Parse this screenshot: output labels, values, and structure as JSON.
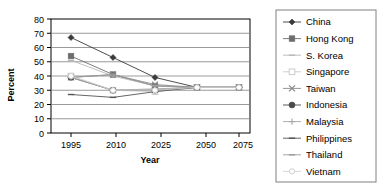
{
  "chart_data": {
    "type": "line",
    "title": "",
    "xlabel": "Year",
    "ylabel": "Percent",
    "categories": [
      "1995",
      "2010",
      "2025",
      "2050",
      "2075"
    ],
    "x": [
      1995,
      2010,
      2025,
      2050,
      2075
    ],
    "ylim": [
      0,
      80
    ],
    "yticks": [
      0,
      10,
      20,
      30,
      40,
      50,
      60,
      70,
      80
    ],
    "grid": true,
    "legend_position": "right",
    "series": [
      {
        "name": "China",
        "marker": "filled-diamond",
        "values": [
          67,
          53,
          39,
          32,
          32
        ]
      },
      {
        "name": "Hong Kong",
        "marker": "filled-square",
        "values": [
          54,
          41,
          33,
          32,
          32
        ]
      },
      {
        "name": "S. Korea",
        "marker": "light-dash",
        "values": [
          51,
          40,
          33,
          32,
          32
        ]
      },
      {
        "name": "Singapore",
        "marker": "open-square",
        "values": [
          40,
          30,
          29,
          32,
          32
        ]
      },
      {
        "name": "Taiwan",
        "marker": "cross-x",
        "values": [
          39,
          41,
          34,
          32,
          32
        ]
      },
      {
        "name": "Indonesia",
        "marker": "filled-circle",
        "values": [
          39,
          30,
          30,
          32,
          32
        ]
      },
      {
        "name": "Malaysia",
        "marker": "plus",
        "values": [
          39,
          30,
          31,
          32,
          32
        ]
      },
      {
        "name": "Philippines",
        "marker": "small-dash",
        "values": [
          27,
          25,
          29,
          32,
          32
        ]
      },
      {
        "name": "Thailand",
        "marker": "dash",
        "values": [
          39,
          41,
          33,
          32,
          32
        ]
      },
      {
        "name": "Vietnam",
        "marker": "dot",
        "values": [
          40,
          30,
          30,
          32,
          32
        ]
      }
    ]
  },
  "axes": {
    "ylabel": "Percent",
    "xlabel": "Year",
    "ytick_labels": [
      "80",
      "70",
      "60",
      "50",
      "40",
      "30",
      "20",
      "10",
      "0"
    ],
    "xtick_labels": [
      "1995",
      "2010",
      "2025",
      "2050",
      "2075"
    ]
  },
  "legend": {
    "items": [
      {
        "label": "China",
        "marker": "filled-diamond",
        "color": "#3a3a3a"
      },
      {
        "label": "Hong Kong",
        "marker": "filled-square",
        "color": "#6d6d6d"
      },
      {
        "label": "S. Korea",
        "marker": "light-dash",
        "color": "#b8b8b8"
      },
      {
        "label": "Singapore",
        "marker": "open-square",
        "color": "#cccccc"
      },
      {
        "label": "Taiwan",
        "marker": "cross-x",
        "color": "#8a8a8a"
      },
      {
        "label": "Indonesia",
        "marker": "filled-circle",
        "color": "#4a4a4a"
      },
      {
        "label": "Malaysia",
        "marker": "plus",
        "color": "#a5a5a5"
      },
      {
        "label": "Philippines",
        "marker": "small-dash",
        "color": "#555555"
      },
      {
        "label": "Thailand",
        "marker": "dash",
        "color": "#9a9a9a"
      },
      {
        "label": "Vietnam",
        "marker": "dot",
        "color": "#d0d0d0"
      }
    ]
  },
  "colors": {
    "plot_border": "#000000",
    "gridline": "#808080",
    "legend_border": "#808080",
    "background": "#ffffff"
  }
}
